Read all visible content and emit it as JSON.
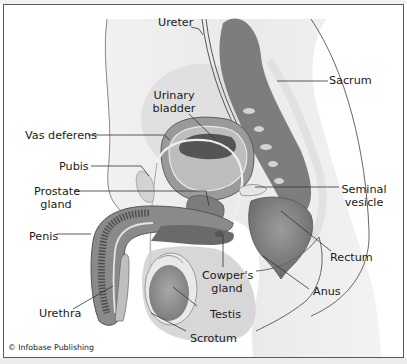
{
  "figure": {
    "credit": "© Infobase Publishing",
    "colors": {
      "frame": "#5a5a5a",
      "tissue_dark": "#6f6f6f",
      "tissue_mid": "#9a9a9a",
      "tissue_light": "#c8c8c8",
      "skin": "#dcdcdc",
      "lumen": "#4a4a4a",
      "leader": "#333333"
    }
  },
  "labels": {
    "ureter": "Ureter",
    "sacrum": "Sacrum",
    "urinary_bladder_1": "Urinary",
    "urinary_bladder_2": "bladder",
    "vas_deferens": "Vas deferens",
    "pubis": "Pubis",
    "prostate_1": "Prostate",
    "prostate_2": "gland",
    "seminal_1": "Seminal",
    "seminal_2": "vesicle",
    "penis": "Penis",
    "rectum": "Rectum",
    "cowpers_1": "Cowper's",
    "cowpers_2": "gland",
    "anus": "Anus",
    "testis": "Testis",
    "urethra": "Urethra",
    "scrotum": "Scrotum"
  }
}
